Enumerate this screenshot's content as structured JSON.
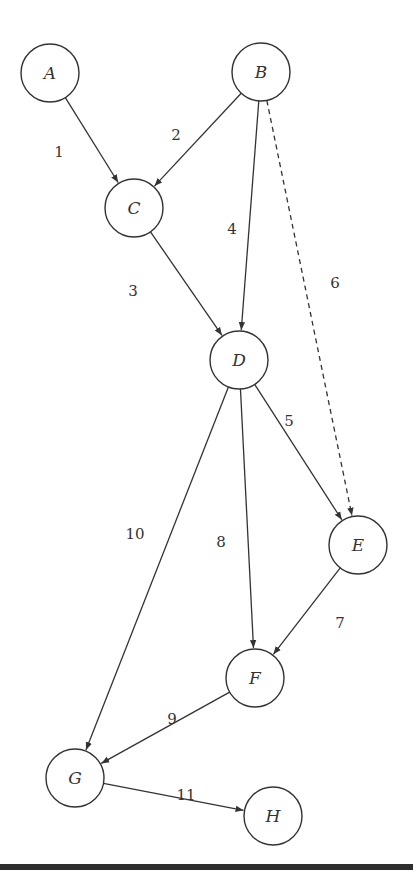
{
  "diagram": {
    "type": "directed-graph",
    "nodes": [
      {
        "id": "A",
        "label": "A",
        "x": 50,
        "y": 73
      },
      {
        "id": "B",
        "label": "B",
        "x": 261,
        "y": 72
      },
      {
        "id": "C",
        "label": "C",
        "x": 134,
        "y": 208
      },
      {
        "id": "D",
        "label": "D",
        "x": 239,
        "y": 360
      },
      {
        "id": "E",
        "label": "E",
        "x": 358,
        "y": 545
      },
      {
        "id": "F",
        "label": "F",
        "x": 255,
        "y": 678
      },
      {
        "id": "G",
        "label": "G",
        "x": 75,
        "y": 778
      },
      {
        "id": "H",
        "label": "H",
        "x": 273,
        "y": 816
      }
    ],
    "edges": [
      {
        "id": "1",
        "label": "1",
        "from": "A",
        "to": "C",
        "style": "solid",
        "lx": 59,
        "ly": 153
      },
      {
        "id": "2",
        "label": "2",
        "from": "B",
        "to": "C",
        "style": "solid",
        "lx": 176,
        "ly": 136
      },
      {
        "id": "3",
        "label": "3",
        "from": "C",
        "to": "D",
        "style": "solid",
        "lx": 133,
        "ly": 292
      },
      {
        "id": "4",
        "label": "4",
        "from": "B",
        "to": "D",
        "style": "solid",
        "lx": 232,
        "ly": 230
      },
      {
        "id": "5",
        "label": "5",
        "from": "D",
        "to": "E",
        "style": "solid",
        "lx": 289,
        "ly": 422
      },
      {
        "id": "6",
        "label": "6",
        "from": "B",
        "to": "E",
        "style": "dashed",
        "lx": 335,
        "ly": 284
      },
      {
        "id": "7",
        "label": "7",
        "from": "E",
        "to": "F",
        "style": "solid",
        "lx": 340,
        "ly": 624
      },
      {
        "id": "8",
        "label": "8",
        "from": "D",
        "to": "F",
        "style": "solid",
        "lx": 221,
        "ly": 543
      },
      {
        "id": "9",
        "label": "9",
        "from": "F",
        "to": "G",
        "style": "solid",
        "lx": 172,
        "ly": 720
      },
      {
        "id": "10",
        "label": "10",
        "from": "D",
        "to": "G",
        "style": "solid",
        "lx": 135,
        "ly": 535
      },
      {
        "id": "11",
        "label": "11",
        "from": "G",
        "to": "H",
        "style": "solid",
        "lx": 186,
        "ly": 796
      }
    ],
    "node_radius": 29
  }
}
